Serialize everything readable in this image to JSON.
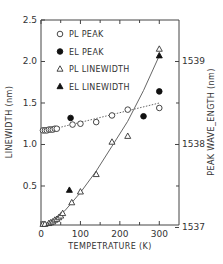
{
  "chart_data": {
    "type": "scatter",
    "title": "",
    "xlabel": "TEMPETRATURE (K)",
    "ylabel": "LINEWIDTH (nm)",
    "y2label": "PEAK WAVE_ENGTH (nm)",
    "xlim": [
      0,
      350
    ],
    "ylim": [
      0.03,
      2.5
    ],
    "y2lim": [
      1537.03,
      1539.5
    ],
    "x_ticks": [
      0,
      100,
      200,
      300
    ],
    "x_minor_ticks": [
      50,
      150,
      250
    ],
    "y_ticks": [
      {
        "value": 0.5,
        "label": "0.5"
      },
      {
        "value": 1.0,
        "label": "1.0"
      },
      {
        "value": 1.5,
        "label": "1.5"
      },
      {
        "value": 2.0,
        "label": "2.0"
      },
      {
        "value": 2.5,
        "label": "2.5"
      }
    ],
    "y2_ticks": [
      {
        "value": 1537,
        "label": "1537"
      },
      {
        "value": 1538,
        "label": "1538"
      },
      {
        "value": 1539,
        "label": "1539"
      }
    ],
    "y2_minor_ticks": [
      1537.5,
      1538.5
    ],
    "legend_position": "top-left",
    "series": [
      {
        "name": "PL PEAK",
        "marker": "open-circle",
        "axis": "right",
        "x": [
          5,
          10,
          15,
          20,
          25,
          30,
          35,
          40,
          80,
          100,
          140,
          180,
          220,
          300
        ],
        "y": [
          1538.17,
          1538.17,
          1538.17,
          1538.18,
          1538.18,
          1538.18,
          1538.19,
          1538.19,
          1538.24,
          1538.25,
          1538.27,
          1538.35,
          1538.42,
          1538.44
        ]
      },
      {
        "name": "EL PEAK",
        "marker": "filled-circle",
        "axis": "right",
        "x": [
          75,
          260,
          300
        ],
        "y": [
          1538.32,
          1538.34,
          1538.64
        ]
      },
      {
        "name": "PL LINEWIDTH",
        "marker": "open-triangle",
        "axis": "left",
        "x": [
          5,
          10,
          20,
          25,
          30,
          35,
          40,
          45,
          50,
          55,
          78,
          100,
          140,
          180,
          220,
          300
        ],
        "y": [
          0.04,
          0.04,
          0.05,
          0.06,
          0.07,
          0.09,
          0.1,
          0.12,
          0.14,
          0.17,
          0.3,
          0.43,
          0.64,
          1.03,
          1.1,
          2.15
        ]
      },
      {
        "name": "EL LINEWIDTH",
        "marker": "filled-triangle",
        "axis": "left",
        "x": [
          72,
          300
        ],
        "y": [
          0.45,
          2.07
        ]
      }
    ],
    "fit_lines": [
      {
        "name": "PL peak trend",
        "style": "dotted",
        "axis": "right",
        "x": [
          0,
          300
        ],
        "y": [
          1538.15,
          1538.5
        ]
      },
      {
        "name": "linewidth fit",
        "style": "solid",
        "axis": "left",
        "x": [
          5,
          30,
          60,
          100,
          140,
          180,
          220,
          260,
          300
        ],
        "y": [
          0.04,
          0.08,
          0.2,
          0.42,
          0.68,
          0.98,
          1.28,
          1.65,
          2.07
        ]
      }
    ]
  }
}
